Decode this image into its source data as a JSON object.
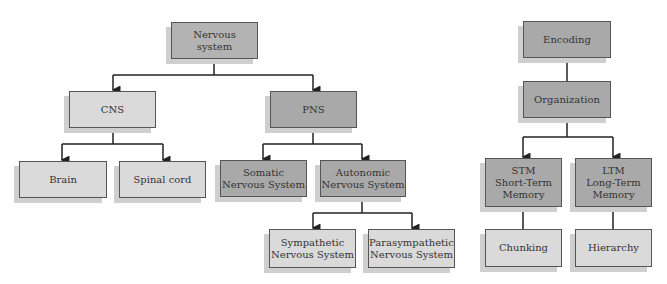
{
  "diagram_left": {
    "title": "Nervous system hierarchy",
    "nodes": {
      "nervous_system": "Nervous\nsystem",
      "cns": "CNS",
      "pns": "PNS",
      "brain": "Brain",
      "spinal_cord": "Spinal cord",
      "somatic": "Somatic\nNervous System",
      "autonomic": "Autonomic\nNervous System",
      "sympathetic": "Sympathetic\nNervous System",
      "parasympathetic": "Parasympathetic\nNervous System"
    },
    "edges": [
      [
        "nervous_system",
        "cns"
      ],
      [
        "nervous_system",
        "pns"
      ],
      [
        "cns",
        "brain"
      ],
      [
        "cns",
        "spinal_cord"
      ],
      [
        "pns",
        "somatic"
      ],
      [
        "pns",
        "autonomic"
      ],
      [
        "autonomic",
        "sympathetic"
      ],
      [
        "autonomic",
        "parasympathetic"
      ]
    ]
  },
  "diagram_right": {
    "title": "Memory hierarchy",
    "nodes": {
      "encoding": "Encoding",
      "organization": "Organization",
      "stm": "STM\nShort-Term\nMemory",
      "ltm": "LTM\nLong-Term\nMemory",
      "chunking": "Chunking",
      "hierarchy": "Hierarchy"
    },
    "edges": [
      [
        "encoding",
        "organization"
      ],
      [
        "organization",
        "stm"
      ],
      [
        "organization",
        "ltm"
      ],
      [
        "stm",
        "chunking"
      ],
      [
        "ltm",
        "hierarchy"
      ]
    ]
  },
  "colors": {
    "dark_box": "#a9a9a9",
    "light_box": "#dadada",
    "shadow": "#cfcfcf",
    "line": "#222222"
  }
}
